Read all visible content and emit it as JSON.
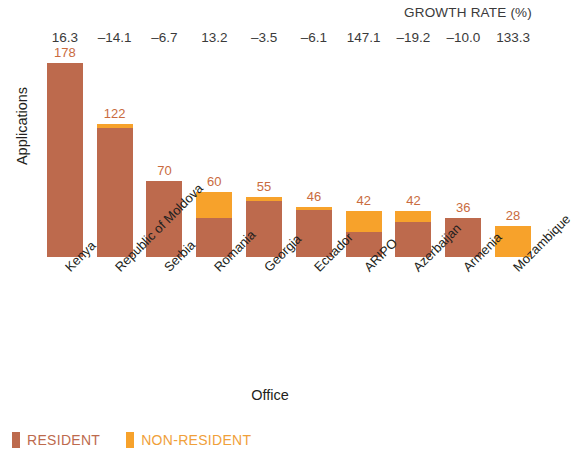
{
  "chart_data": {
    "type": "bar",
    "subtype": "stacked-vertical",
    "title": "",
    "xlabel": "Office",
    "ylabel": "Applications",
    "ylim": [
      0,
      185
    ],
    "grid": false,
    "legend_position": "bottom-left",
    "categories": [
      "Kenya",
      "Republic of Moldova",
      "Serbia",
      "Romania",
      "Georgia",
      "Ecuador",
      "ARIPO",
      "Azerbaijan",
      "Armenia",
      "Mozambique"
    ],
    "series": [
      {
        "name": "RESIDENT",
        "color": "#bd6a4d",
        "values": [
          178,
          118,
          70,
          36,
          51,
          43,
          23,
          32,
          36,
          0
        ]
      },
      {
        "name": "NON-RESIDENT",
        "color": "#f7a22b",
        "values": [
          0,
          4,
          0,
          24,
          4,
          3,
          19,
          10,
          0,
          28
        ]
      }
    ],
    "totals": [
      178,
      122,
      70,
      60,
      55,
      46,
      42,
      42,
      36,
      28
    ],
    "total_labels": [
      "178",
      "122",
      "70",
      "60",
      "55",
      "46",
      "42",
      "42",
      "36",
      "28"
    ],
    "annotation_row": {
      "title": "GROWTH RATE (%)",
      "values": [
        "16.3",
        "–14.1",
        "–6.7",
        "13.2",
        "–3.5",
        "–6.1",
        "147.1",
        "–19.2",
        "–10.0",
        "133.3"
      ]
    }
  },
  "legend": {
    "items": [
      {
        "label": "RESIDENT",
        "color": "#bd6a4d",
        "text_color": "#bd6a4d"
      },
      {
        "label": "NON-RESIDENT",
        "color": "#f7a22b",
        "text_color": "#f0a03a"
      }
    ]
  }
}
